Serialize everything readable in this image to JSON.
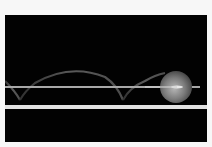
{
  "image": {
    "description": "Long-exposure photograph of a ball bouncing along a track",
    "subject": "bouncing-ball",
    "colors": {
      "background": "#020202",
      "border": "#f7f7f7",
      "rail": "#d8d8d8",
      "trail": "#6a6a6a",
      "ball": "#8a8a8a"
    }
  }
}
